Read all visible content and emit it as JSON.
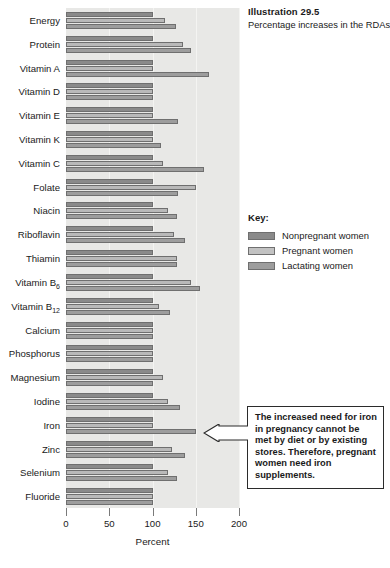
{
  "title": {
    "illustration_number": "Illustration 29.5",
    "description": "Percentage increases in the RDAs for pregnant and breast-feeding women compared with nonpregnant women"
  },
  "legend": {
    "key_label": "Key:",
    "entries": [
      {
        "label": "Nonpregnant women",
        "color": "#8a8a8a"
      },
      {
        "label": "Pregnant women",
        "color": "#c2c2c2"
      },
      {
        "label": "Lactating women",
        "color": "#9d9d9d"
      }
    ]
  },
  "callout": {
    "text": "The increased need for iron in pregnancy cannot be met by diet or by existing stores. Therefore, pregnant women need iron supplements.",
    "points_to": "Iron"
  },
  "chart_data": {
    "type": "bar",
    "orientation": "horizontal",
    "title": "Percentage increases in the RDAs for pregnant and breast-feeding women compared with nonpregnant women",
    "xlabel": "Percent",
    "ylabel": "",
    "xlim": [
      0,
      200
    ],
    "xticks": [
      0,
      50,
      100,
      150,
      200
    ],
    "xtick_labels": [
      "0",
      "50",
      "100",
      "150",
      "200"
    ],
    "grid": true,
    "legend_position": "right",
    "categories": [
      "Energy",
      "Protein",
      "Vitamin A",
      "Vitamin D",
      "Vitamin E",
      "Vitamin K",
      "Vitamin C",
      "Folate",
      "Niacin",
      "Riboflavin",
      "Thiamin",
      "Vitamin B6",
      "Vitamin B12",
      "Calcium",
      "Phosphorus",
      "Magnesium",
      "Iodine",
      "Iron",
      "Zinc",
      "Selenium",
      "Fluoride"
    ],
    "category_labels_html": [
      "Energy",
      "Protein",
      "Vitamin A",
      "Vitamin D",
      "Vitamin E",
      "Vitamin K",
      "Vitamin C",
      "Folate",
      "Niacin",
      "Riboflavin",
      "Thiamin",
      "Vitamin B<sub>6</sub>",
      "Vitamin B<sub>12</sub>",
      "Calcium",
      "Phosphorus",
      "Magnesium",
      "Iodine",
      "Iron",
      "Zinc",
      "Selenium",
      "Fluoride"
    ],
    "series": [
      {
        "name": "Nonpregnant women",
        "color": "#8a8a8a",
        "values": [
          100,
          100,
          100,
          100,
          100,
          100,
          100,
          100,
          100,
          100,
          100,
          100,
          100,
          100,
          100,
          100,
          100,
          100,
          100,
          100,
          100
        ]
      },
      {
        "name": "Pregnant women",
        "color": "#c2c2c2",
        "values": [
          115,
          135,
          100,
          100,
          100,
          100,
          112,
          150,
          118,
          125,
          128,
          145,
          108,
          100,
          100,
          112,
          118,
          100,
          122,
          118,
          100
        ]
      },
      {
        "name": "Lactating women",
        "color": "#9d9d9d",
        "values": [
          127,
          145,
          165,
          100,
          130,
          110,
          160,
          130,
          128,
          138,
          128,
          155,
          120,
          100,
          100,
          100,
          132,
          150,
          138,
          128,
          100
        ]
      }
    ]
  }
}
